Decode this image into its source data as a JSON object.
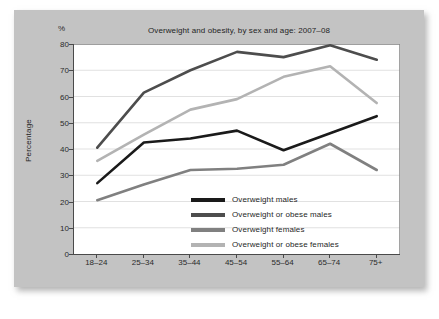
{
  "figure": {
    "unit_label": "%",
    "panel_color": "#c3c3c3",
    "plot_bg_color": "#ffffff",
    "axis_color": "#4a4a4a",
    "grid_color": "#d9d9d9"
  },
  "chart_data": {
    "type": "line",
    "title": "Overweight and obesity, by sex and age: 2007–08",
    "xlabel": "",
    "ylabel": "Percentage",
    "unit": "%",
    "categories": [
      "18–24",
      "25–34",
      "35–44",
      "45–54",
      "55–64",
      "65–74",
      "75+"
    ],
    "ylim": [
      0,
      80
    ],
    "yticks": [
      0,
      10,
      20,
      30,
      40,
      50,
      60,
      70,
      80
    ],
    "grid": "horizontal",
    "legend_position": "inside-bottom-right",
    "series": [
      {
        "name": "Overweight males",
        "color": "#1a1a1a",
        "values": [
          27,
          42.5,
          44,
          47,
          39.5,
          46,
          52.5
        ]
      },
      {
        "name": "Overweight or obese males",
        "color": "#4d4d4d",
        "values": [
          40.5,
          61.5,
          70,
          77,
          75,
          79.5,
          74
        ]
      },
      {
        "name": "Overweight females",
        "color": "#808080",
        "values": [
          20.5,
          26.5,
          32,
          32.5,
          34,
          42,
          32
        ]
      },
      {
        "name": "Overweight or obese females",
        "color": "#b3b3b3",
        "values": [
          35.5,
          45.5,
          55,
          59,
          67.5,
          71.5,
          57.5
        ]
      }
    ]
  }
}
